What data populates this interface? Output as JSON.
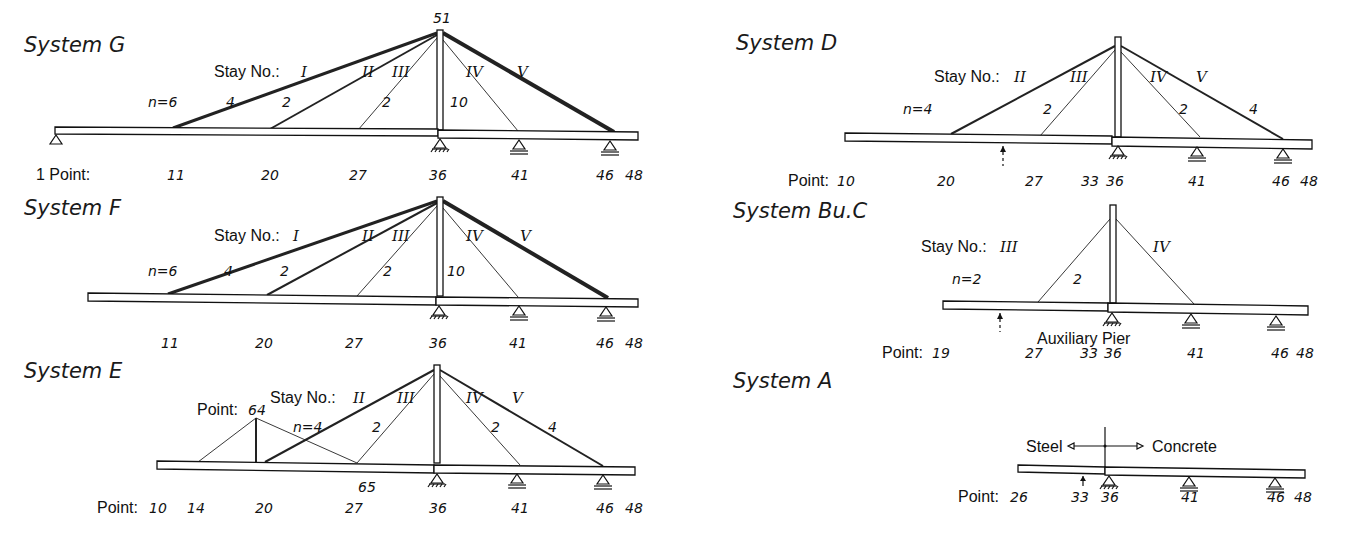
{
  "systems": {
    "G": {
      "title": "System G",
      "top_label": "51",
      "stay_label": "Stay No.:",
      "stays": [
        {
          "id": "I",
          "n": "n=6"
        },
        {
          "id": "II",
          "n": "4"
        },
        {
          "id": "III",
          "n": "2"
        },
        {
          "id": "IV",
          "n": "2"
        },
        {
          "id": "V",
          "n": "10"
        }
      ],
      "point_label": "1 Point:",
      "points": [
        "11",
        "20",
        "27",
        "36",
        "41",
        "46",
        "48"
      ]
    },
    "F": {
      "title": "System F",
      "stay_label": "Stay No.:",
      "stays": [
        {
          "id": "I",
          "n": "n=6"
        },
        {
          "id": "II",
          "n": "4"
        },
        {
          "id": "III",
          "n": "2"
        },
        {
          "id": "IV",
          "n": "2"
        },
        {
          "id": "V",
          "n": "10"
        }
      ],
      "points": [
        "11",
        "20",
        "27",
        "36",
        "41",
        "46",
        "48"
      ]
    },
    "E": {
      "title": "System E",
      "stay_label": "Stay No.:",
      "aux_point_label": "Point:",
      "aux_point": "64",
      "mid_point": "65",
      "stays": [
        {
          "id": "II",
          "n": "n=4"
        },
        {
          "id": "III",
          "n": "2"
        },
        {
          "id": "IV",
          "n": "2"
        },
        {
          "id": "V",
          "n": "4"
        }
      ],
      "point_label": "Point:",
      "points": [
        "10",
        "14",
        "20",
        "27",
        "36",
        "41",
        "46",
        "48"
      ]
    },
    "D": {
      "title": "System D",
      "stay_label": "Stay No.:",
      "stays": [
        {
          "id": "II",
          "n": "n=4"
        },
        {
          "id": "III",
          "n": "2"
        },
        {
          "id": "IV",
          "n": "2"
        },
        {
          "id": "V",
          "n": "4"
        }
      ],
      "point_label": "Point:",
      "points": [
        "10",
        "20",
        "27",
        "33",
        "36",
        "41",
        "46",
        "48"
      ]
    },
    "BuC": {
      "title": "System Bu.C",
      "stay_label": "Stay No.:",
      "stays": [
        {
          "id": "III",
          "n": "n=2"
        },
        {
          "id": "IV",
          "n": "2"
        }
      ],
      "aux_pier_label": "Auxiliary Pier",
      "point_label": "Point:",
      "points": [
        "19",
        "27",
        "33",
        "36",
        "41",
        "46",
        "48"
      ]
    },
    "A": {
      "title": "System A",
      "left_material": "Steel",
      "right_material": "Concrete",
      "point_label": "Point:",
      "points": [
        "26",
        "33",
        "36",
        "41",
        "46",
        "48"
      ]
    }
  }
}
